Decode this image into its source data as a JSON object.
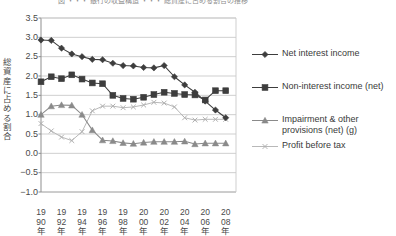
{
  "figure": {
    "title_faint": "図  ・・・ 銀行の収益構造 ・・・ 総資産に占める割合の推移",
    "ylabel": "総資産に占める割合",
    "y_ticks": [
      "3.5",
      "3.0",
      "2.5",
      "2.0",
      "1.5",
      "1.0",
      "0.5",
      "0.0",
      "-0.5",
      "-1.0"
    ],
    "x_ticks": [
      "1990年",
      "1992年",
      "1994年",
      "1996年",
      "1998年",
      "2000年",
      "2002年",
      "2004年",
      "2006年",
      "2008年"
    ]
  },
  "legend": {
    "position": "right",
    "items": [
      {
        "label": "Net interest income",
        "marker": "diamond",
        "color": "#3d3d3d"
      },
      {
        "label": "Non-interest income (net)",
        "marker": "square",
        "color": "#3d3d3d"
      },
      {
        "label": "Impairment & other\nprovisions (net) (g)",
        "marker": "triangle",
        "color": "#8a8a8a"
      },
      {
        "label": "Profit before tax",
        "marker": "cross",
        "color": "#b0b0b0"
      }
    ]
  },
  "chart_data": {
    "type": "line",
    "title": "",
    "xlabel": "",
    "ylabel": "総資産に占める割合",
    "xlim": [
      1990,
      2009
    ],
    "ylim": [
      -1.0,
      3.5
    ],
    "yticks": [
      -1.0,
      -0.5,
      0.0,
      0.5,
      1.0,
      1.5,
      2.0,
      2.5,
      3.0,
      3.5
    ],
    "grid": "horizontal",
    "legend_position": "right",
    "x": [
      1990,
      1991,
      1992,
      1993,
      1994,
      1995,
      1996,
      1997,
      1998,
      1999,
      2000,
      2001,
      2002,
      2003,
      2004,
      2005,
      2006,
      2007,
      2008
    ],
    "series": [
      {
        "name": "Net interest income",
        "marker": "diamond",
        "color": "#3d3d3d",
        "values": [
          2.93,
          2.92,
          2.72,
          2.57,
          2.5,
          2.43,
          2.42,
          2.33,
          2.27,
          2.26,
          2.22,
          2.21,
          2.27,
          1.98,
          1.77,
          1.58,
          1.35,
          1.12,
          0.92
        ]
      },
      {
        "name": "Non-interest income (net)",
        "marker": "square",
        "color": "#3d3d3d",
        "values": [
          1.85,
          1.98,
          1.93,
          2.03,
          1.92,
          1.82,
          1.8,
          1.5,
          1.42,
          1.4,
          1.45,
          1.52,
          1.58,
          1.55,
          1.52,
          1.51,
          1.38,
          1.62,
          1.62
        ]
      },
      {
        "name": "Impairment & other provisions (net) (g)",
        "marker": "triangle",
        "color": "#8a8a8a",
        "values": [
          1.0,
          1.22,
          1.25,
          1.24,
          1.0,
          0.6,
          0.34,
          0.32,
          0.27,
          0.25,
          0.28,
          0.3,
          0.3,
          0.3,
          0.31,
          0.24,
          0.26,
          0.26,
          0.26
        ]
      },
      {
        "name": "Profit before tax",
        "marker": "cross",
        "color": "#b0b0b0",
        "values": [
          0.77,
          0.58,
          0.42,
          0.33,
          0.56,
          1.1,
          1.22,
          1.22,
          1.18,
          1.2,
          1.25,
          1.32,
          1.3,
          1.2,
          0.92,
          0.86,
          0.88,
          0.88,
          0.88
        ]
      }
    ]
  },
  "geometry": {
    "plot": {
      "left": 41,
      "top": 18,
      "right": 236,
      "bottom": 192
    }
  }
}
